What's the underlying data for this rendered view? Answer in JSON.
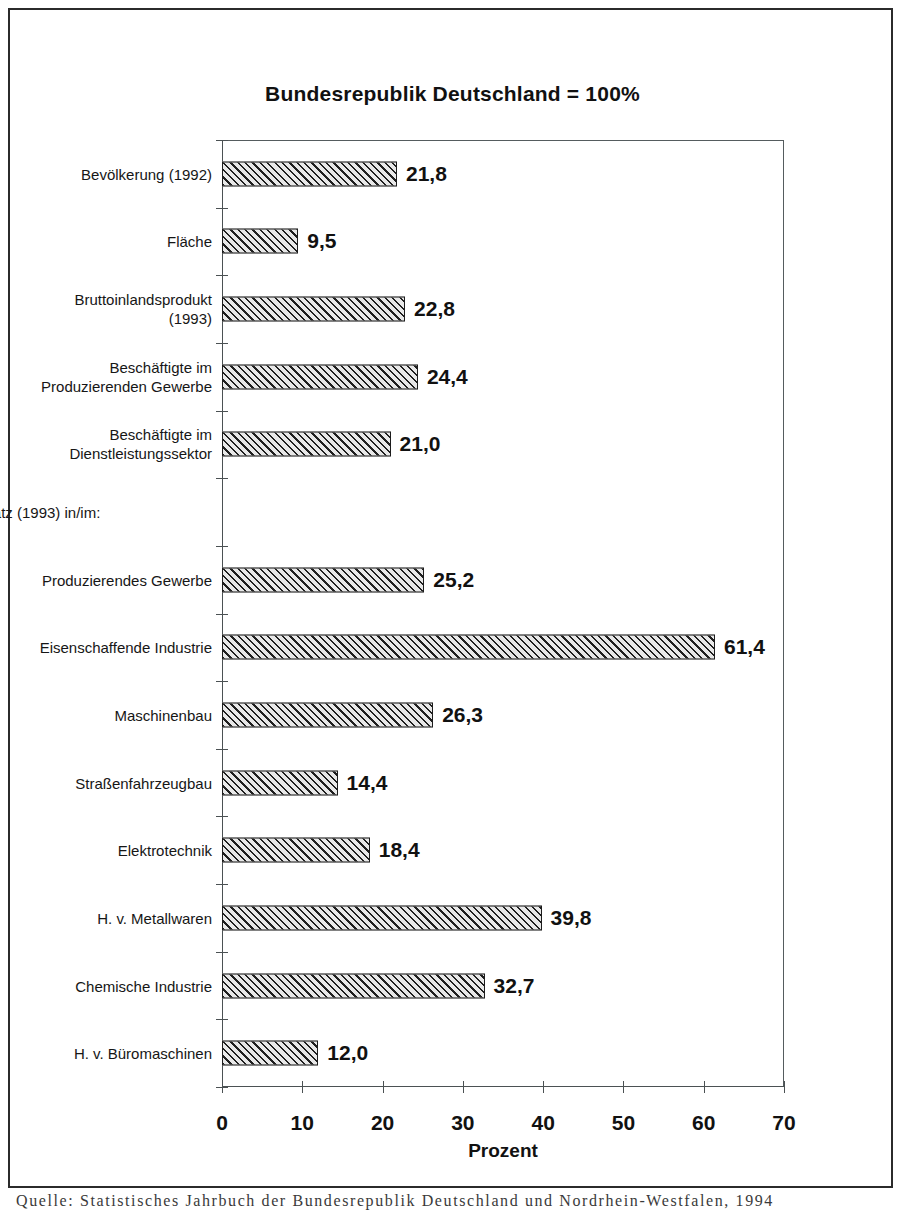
{
  "figure": {
    "title": "Bundesrepublik Deutschland = 100%",
    "x_axis_title": "Prozent",
    "source_note": "Quelle: Statistisches Jahrbuch der Bundesrepublik Deutschland und Nordrhein-Westfalen, 1994",
    "frame_color": "#2b2b2b",
    "bar_fill_color": "#d2d2d2",
    "bar_edge_color": "#1c1c1c",
    "axis_color": "#4b5153"
  },
  "chart_data": {
    "type": "bar",
    "orientation": "horizontal",
    "title": "Bundesrepublik Deutschland = 100%",
    "xlabel": "Prozent",
    "ylabel": "",
    "xlim": [
      0,
      70
    ],
    "xticks": [
      0,
      10,
      20,
      30,
      40,
      50,
      60,
      70
    ],
    "xtick_labels": [
      "0",
      "10",
      "20",
      "30",
      "40",
      "50",
      "60",
      "70"
    ],
    "grid": false,
    "legend": null,
    "decimal_separator": ",",
    "categories": [
      "Bevölkerung (1992)",
      "Fläche",
      "Bruttoinlandsprodukt\n(1993)",
      "Beschäftigte im\nProduzierenden Gewerbe",
      "Beschäftigte im\nDienstleistungssektor",
      "Umsatz (1993) in/im:",
      "Produzierendes Gewerbe",
      "Eisenschaffende Industrie",
      "Maschinenbau",
      "Straßenfahrzeugbau",
      "Elektrotechnik",
      "H. v. Metallwaren",
      "Chemische Industrie",
      "H. v. Büromaschinen"
    ],
    "values": [
      21.8,
      9.5,
      22.8,
      24.4,
      21.0,
      null,
      25.2,
      61.4,
      26.3,
      14.4,
      18.4,
      39.8,
      32.7,
      12.0
    ],
    "value_labels": [
      "21,8",
      "9,5",
      "22,8",
      "24,4",
      "21,0",
      "",
      "25,2",
      "61,4",
      "26,3",
      "14,4",
      "18,4",
      "39,8",
      "32,7",
      "12,0"
    ]
  },
  "rows": [
    {
      "label": "Bevölkerung (1992)",
      "value": 21.8,
      "value_label": "21,8",
      "heading": false
    },
    {
      "label": "Fläche",
      "value": 9.5,
      "value_label": "9,5",
      "heading": false
    },
    {
      "label": "Bruttoinlandsprodukt\n(1993)",
      "value": 22.8,
      "value_label": "22,8",
      "heading": false
    },
    {
      "label": "Beschäftigte im\nProduzierenden Gewerbe",
      "value": 24.4,
      "value_label": "24,4",
      "heading": false
    },
    {
      "label": "Beschäftigte im\nDienstleistungssektor",
      "value": 21.0,
      "value_label": "21,0",
      "heading": false
    },
    {
      "label": "Umsatz (1993) in/im:",
      "value": null,
      "value_label": "",
      "heading": true
    },
    {
      "label": "Produzierendes Gewerbe",
      "value": 25.2,
      "value_label": "25,2",
      "heading": false
    },
    {
      "label": "Eisenschaffende Industrie",
      "value": 61.4,
      "value_label": "61,4",
      "heading": false
    },
    {
      "label": "Maschinenbau",
      "value": 26.3,
      "value_label": "26,3",
      "heading": false
    },
    {
      "label": "Straßenfahrzeugbau",
      "value": 14.4,
      "value_label": "14,4",
      "heading": false
    },
    {
      "label": "Elektrotechnik",
      "value": 18.4,
      "value_label": "18,4",
      "heading": false
    },
    {
      "label": "H. v. Metallwaren",
      "value": 39.8,
      "value_label": "39,8",
      "heading": false
    },
    {
      "label": "Chemische Industrie",
      "value": 32.7,
      "value_label": "32,7",
      "heading": false
    },
    {
      "label": "H. v. Büromaschinen",
      "value": 12.0,
      "value_label": "12,0",
      "heading": false
    }
  ]
}
